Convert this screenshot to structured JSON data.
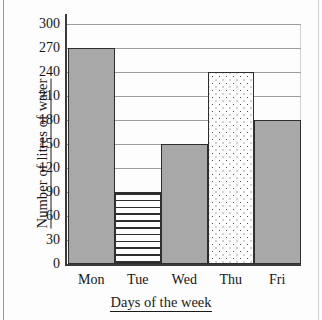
{
  "chart_data": {
    "type": "bar",
    "title": "",
    "subtitle": "",
    "xlabel": "Days of the week",
    "ylabel": "Number of litres of water",
    "categories": [
      "Mon",
      "Tue",
      "Wed",
      "Thu",
      "Fri"
    ],
    "values": [
      270,
      90,
      150,
      240,
      180
    ],
    "ylim": [
      0,
      300
    ],
    "ytick_step": 30,
    "yticks": [
      0,
      30,
      60,
      90,
      120,
      150,
      180,
      210,
      240,
      270,
      300
    ],
    "ytick_labels": [
      "0",
      "30",
      "60",
      "90",
      "120",
      "150",
      "180",
      "210",
      "240",
      "270",
      "300"
    ],
    "grid": true,
    "grid_axis": "y",
    "legend": false,
    "legend_position": "none",
    "bar_gap": 0,
    "bar_fills": [
      "solid-grey",
      "horizontal-lines",
      "solid-grey",
      "dotted",
      "solid-grey"
    ],
    "colors": {
      "bar_solid": "#a8a8a8",
      "bar_outline": "#2e2e2e",
      "gridline": "#9d9d9d",
      "axis": "#3b3b3b",
      "background": "#fdfdfd",
      "text": "#141414"
    },
    "annotations": []
  },
  "axis": {
    "y_title": "Number of litres of water",
    "x_title": "Days of the week"
  }
}
